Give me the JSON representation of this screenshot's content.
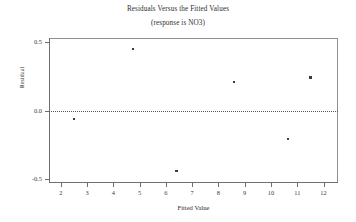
{
  "chart_data": {
    "type": "scatter",
    "title": "Residuals Versus the Fitted Values",
    "subtitle": "(response is NO3)",
    "xlabel": "Fitted Value",
    "ylabel": "Residual",
    "xlim": [
      1.55,
      12.55
    ],
    "ylim": [
      -0.53,
      0.53
    ],
    "xticks": [
      2,
      3,
      4,
      5,
      6,
      7,
      8,
      9,
      10,
      11,
      12
    ],
    "xtick_labels": [
      "2",
      "3",
      "4",
      "5",
      "6",
      "7",
      "8",
      "9",
      "10",
      "11",
      "12"
    ],
    "yticks": [
      0.5,
      0.0,
      -0.5
    ],
    "ytick_labels": [
      "0.5",
      "0.0",
      "-0.5"
    ],
    "grid": false,
    "legend": null,
    "reference_line": {
      "orientation": "horizontal",
      "value": 0.0,
      "style": "dotted"
    },
    "points": [
      {
        "x": 2.5,
        "y": -0.06
      },
      {
        "x": 4.75,
        "y": 0.45
      },
      {
        "x": 6.4,
        "y": -0.44
      },
      {
        "x": 8.6,
        "y": 0.21
      },
      {
        "x": 10.65,
        "y": -0.21
      },
      {
        "x": 11.5,
        "y": 0.24
      }
    ],
    "marker": {
      "shape": "square",
      "color": "#3b3b3b",
      "size": 2.4
    }
  }
}
